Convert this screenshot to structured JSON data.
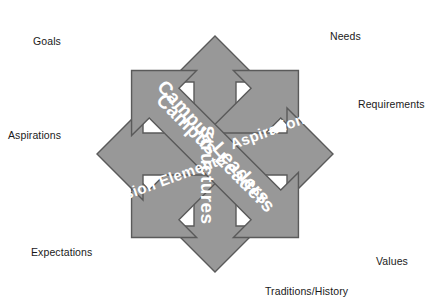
{
  "diagram": {
    "colors": {
      "arrow_fill": "#989898",
      "arrow_stroke": "#5a5a5a",
      "arrow_text": "#ffffff",
      "outer_text": "#1a1a1a",
      "background": "#ffffff"
    },
    "center_labels": [
      {
        "id": "campus-leaders-diagonal",
        "text": "Campus Leaders"
      },
      {
        "id": "campus-leaders-counter-diagonal",
        "text": "Campus Leaders"
      },
      {
        "id": "mission-elements",
        "text": "Mission Elements"
      },
      {
        "id": "aspirations-inner",
        "text": "Aspirations"
      },
      {
        "id": "structures-vertical",
        "text": "Structures"
      }
    ],
    "outer_labels": [
      {
        "id": "goals",
        "text": "Goals"
      },
      {
        "id": "needs",
        "text": "Needs"
      },
      {
        "id": "requirements",
        "text": "Requirements"
      },
      {
        "id": "aspirations",
        "text": "Aspirations"
      },
      {
        "id": "expectations",
        "text": "Expectations"
      },
      {
        "id": "values",
        "text": "Values"
      },
      {
        "id": "traditions-history",
        "text": "Traditions/History"
      }
    ]
  }
}
